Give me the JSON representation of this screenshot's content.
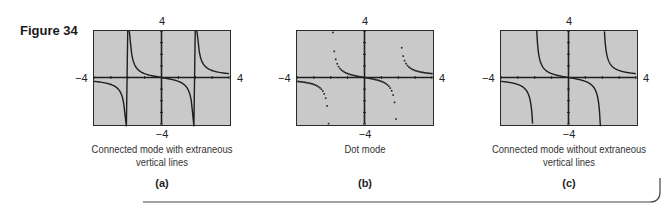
{
  "figure_label": "Figure 34",
  "chart_data": [
    {
      "type": "line",
      "function": "y = x/(x^2 - 4)",
      "title": "Connected mode with extraneous vertical lines",
      "panel": "(a)",
      "mode": "connected",
      "extraneous_vertical_lines": true,
      "xlim": [
        -4,
        4
      ],
      "ylim": [
        -4,
        4
      ],
      "x_ticks_step": 1,
      "y_ticks_step": 1,
      "asymptotes_x": [
        -2,
        2
      ],
      "tick_labels": {
        "top": "4",
        "bottom": "−4",
        "left": "−4",
        "right": "4"
      }
    },
    {
      "type": "scatter",
      "function": "y = x/(x^2 - 4)",
      "title": "Dot mode",
      "panel": "(b)",
      "mode": "dot",
      "xlim": [
        -4,
        4
      ],
      "ylim": [
        -4,
        4
      ],
      "x_ticks_step": 1,
      "y_ticks_step": 1,
      "tick_labels": {
        "top": "4",
        "bottom": "−4",
        "left": "−4",
        "right": "4"
      }
    },
    {
      "type": "line",
      "function": "y = x/(x^2 - 4)",
      "title": "Connected mode without extraneous vertical lines",
      "panel": "(c)",
      "mode": "connected",
      "extraneous_vertical_lines": false,
      "xlim": [
        -4,
        4
      ],
      "ylim": [
        -4,
        4
      ],
      "x_ticks_step": 1,
      "y_ticks_step": 1,
      "asymptotes_x": [
        -2,
        2
      ],
      "tick_labels": {
        "top": "4",
        "bottom": "−4",
        "left": "−4",
        "right": "4"
      }
    }
  ],
  "panels": [
    {
      "caption_line1": "Connected mode with extraneous",
      "caption_line2": "vertical lines",
      "sub": "(a)",
      "top": "4",
      "bottom": "−4",
      "left": "−4",
      "right": "4"
    },
    {
      "caption_line1": "Dot mode",
      "caption_line2": "",
      "sub": "(b)",
      "top": "4",
      "bottom": "−4",
      "left": "−4",
      "right": "4"
    },
    {
      "caption_line1": "Connected mode without extraneous",
      "caption_line2": "vertical lines",
      "sub": "(c)",
      "top": "4",
      "bottom": "−4",
      "left": "−4",
      "right": "4"
    }
  ],
  "colors": {
    "screen_bg": "#c9c9c9",
    "curve": "#1e1e1e",
    "frame": "#2a2a2a"
  }
}
